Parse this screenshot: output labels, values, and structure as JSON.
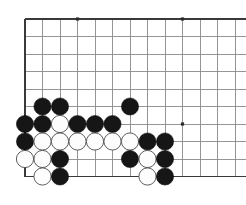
{
  "meta": {
    "kind": "go-board-corner-diagram",
    "board_size": 19,
    "view": "bottom-left corner, cropped right and bottom",
    "background_color": "#ffffff",
    "grid_line_color": "#8a8a8a",
    "edge_line_color": "#3a3a3a",
    "black_stone_color": "#161616",
    "white_stone_color": "#fdfdfd"
  },
  "geometry": {
    "origin_x": 25,
    "origin_y": 19,
    "spacing": 17.5,
    "columns_visible": 13,
    "rows_visible": 10,
    "stone_radius": 8.6,
    "left_edge_x": 25,
    "top_edge_y": 19,
    "bottom_edge_y": 176.5,
    "bottom_edge_x_end": 246,
    "top_edge_x_end": 246,
    "right_crop_x": 246
  },
  "star_points": [
    {
      "name": "star-point-top-left",
      "col": 4,
      "row": 1,
      "x": 77.5,
      "y": 19
    },
    {
      "name": "star-point-top-middle",
      "col": 10,
      "row": 1,
      "x": 182.5,
      "y": 19
    },
    {
      "name": "star-point-middle-right",
      "col": 10,
      "row": 7,
      "x": 182.5,
      "y": 124
    }
  ],
  "stones": [
    {
      "color": "black",
      "col": 2,
      "row": 6,
      "x": 42.5,
      "y": 106.5,
      "label": "black-stone-c2r6"
    },
    {
      "color": "black",
      "col": 3,
      "row": 6,
      "x": 60,
      "y": 106.5,
      "label": "black-stone-c3r6"
    },
    {
      "color": "black",
      "col": 7,
      "row": 6,
      "x": 130,
      "y": 106.5,
      "label": "black-stone-c7r6"
    },
    {
      "color": "black",
      "col": 1,
      "row": 7,
      "x": 25,
      "y": 124,
      "label": "black-stone-c1r7"
    },
    {
      "color": "black",
      "col": 2,
      "row": 7,
      "x": 42.5,
      "y": 124,
      "label": "black-stone-c2r7"
    },
    {
      "color": "white",
      "col": 3,
      "row": 7,
      "x": 60,
      "y": 124,
      "label": "white-stone-c3r7"
    },
    {
      "color": "black",
      "col": 4,
      "row": 7,
      "x": 77.5,
      "y": 124,
      "label": "black-stone-c4r7"
    },
    {
      "color": "black",
      "col": 5,
      "row": 7,
      "x": 95,
      "y": 124,
      "label": "black-stone-c5r7"
    },
    {
      "color": "black",
      "col": 6,
      "row": 7,
      "x": 112.5,
      "y": 124,
      "label": "black-stone-c6r7"
    },
    {
      "color": "black",
      "col": 1,
      "row": 8,
      "x": 25,
      "y": 141.5,
      "label": "black-stone-c1r8"
    },
    {
      "color": "white",
      "col": 2,
      "row": 8,
      "x": 42.5,
      "y": 141.5,
      "label": "white-stone-c2r8"
    },
    {
      "color": "white",
      "col": 3,
      "row": 8,
      "x": 60,
      "y": 141.5,
      "label": "white-stone-c3r8"
    },
    {
      "color": "white",
      "col": 4,
      "row": 8,
      "x": 77.5,
      "y": 141.5,
      "label": "white-stone-c4r8"
    },
    {
      "color": "white",
      "col": 5,
      "row": 8,
      "x": 95,
      "y": 141.5,
      "label": "white-stone-c5r8"
    },
    {
      "color": "white",
      "col": 6,
      "row": 8,
      "x": 112.5,
      "y": 141.5,
      "label": "white-stone-c6r8"
    },
    {
      "color": "white",
      "col": 7,
      "row": 8,
      "x": 130,
      "y": 141.5,
      "label": "white-stone-c7r8"
    },
    {
      "color": "black",
      "col": 8,
      "row": 8,
      "x": 147.5,
      "y": 141.5,
      "label": "black-stone-c8r8"
    },
    {
      "color": "black",
      "col": 9,
      "row": 8,
      "x": 165,
      "y": 141.5,
      "label": "black-stone-c9r8"
    },
    {
      "color": "white",
      "col": 1,
      "row": 9,
      "x": 25,
      "y": 159,
      "label": "white-stone-c1r9"
    },
    {
      "color": "white",
      "col": 2,
      "row": 9,
      "x": 42.5,
      "y": 159,
      "label": "white-stone-c2r9"
    },
    {
      "color": "black",
      "col": 3,
      "row": 9,
      "x": 60,
      "y": 159,
      "label": "black-stone-c3r9"
    },
    {
      "color": "black",
      "col": 7,
      "row": 9,
      "x": 130,
      "y": 159,
      "label": "black-stone-c7r9"
    },
    {
      "color": "white",
      "col": 8,
      "row": 9,
      "x": 147.5,
      "y": 159,
      "label": "white-stone-c8r9"
    },
    {
      "color": "black",
      "col": 9,
      "row": 9,
      "x": 165,
      "y": 159,
      "label": "black-stone-c9r9"
    },
    {
      "color": "white",
      "col": 2,
      "row": 10,
      "x": 42.5,
      "y": 176.5,
      "label": "white-stone-c2r10"
    },
    {
      "color": "black",
      "col": 3,
      "row": 10,
      "x": 60,
      "y": 176.5,
      "label": "black-stone-c3r10"
    },
    {
      "color": "white",
      "col": 8,
      "row": 10,
      "x": 147.5,
      "y": 176.5,
      "label": "white-stone-c8r10"
    },
    {
      "color": "black",
      "col": 9,
      "row": 10,
      "x": 165,
      "y": 176.5,
      "label": "black-stone-c9r10"
    }
  ],
  "counts": {
    "black_stones": 17,
    "white_stones": 11,
    "total_stones": 28
  }
}
